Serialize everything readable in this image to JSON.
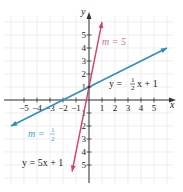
{
  "chart_data": {
    "type": "line",
    "title": "",
    "xlabel": "x",
    "ylabel": "y",
    "xlim": [
      -6.5,
      6.5
    ],
    "ylim": [
      -6.5,
      6.5
    ],
    "grid": true,
    "x_ticks": [
      -5,
      -4,
      -3,
      -2,
      -1,
      1,
      2,
      3,
      4,
      5
    ],
    "y_ticks": [
      -5,
      -4,
      -3,
      -2,
      -1,
      1,
      2,
      3,
      4,
      5
    ],
    "series": [
      {
        "name": "y = 5x + 1",
        "slope": 5,
        "intercept": 1,
        "slope_label": "m = 5",
        "color": "#d2426e",
        "x": [
          -1.3,
          1.0
        ],
        "y": [
          -5.5,
          6.0
        ]
      },
      {
        "name": "y = 1/2 x + 1",
        "slope": 0.5,
        "intercept": 1,
        "slope_label": "m = 1/2",
        "color": "#2a8fb8",
        "x": [
          -6.0,
          6.0
        ],
        "y": [
          -2.0,
          4.0
        ]
      }
    ],
    "annotations": [
      {
        "text": "m = 5",
        "near": "pink line upper"
      },
      {
        "text": "y = 1/2 x + 1",
        "near": "blue line right"
      },
      {
        "text": "m = 1/2",
        "near": "blue line lower left"
      },
      {
        "text": "y = 5x + 1",
        "near": "pink line lower"
      }
    ]
  },
  "labels": {
    "x_axis": "x",
    "y_axis": "y",
    "pink_slope": "m = 5",
    "blue_eq_prefix": "y = ",
    "blue_eq_num": "1",
    "blue_eq_den": "2",
    "blue_eq_suffix": "x + 1",
    "blue_slope_prefix": "m = ",
    "blue_slope_num": "1",
    "blue_slope_den": "2",
    "pink_eq": "y = 5x + 1"
  },
  "colors": {
    "pink_line": "#d2426e",
    "blue_line": "#2a8fb8",
    "grid": "#e4e4e4",
    "axis": "#333333"
  }
}
